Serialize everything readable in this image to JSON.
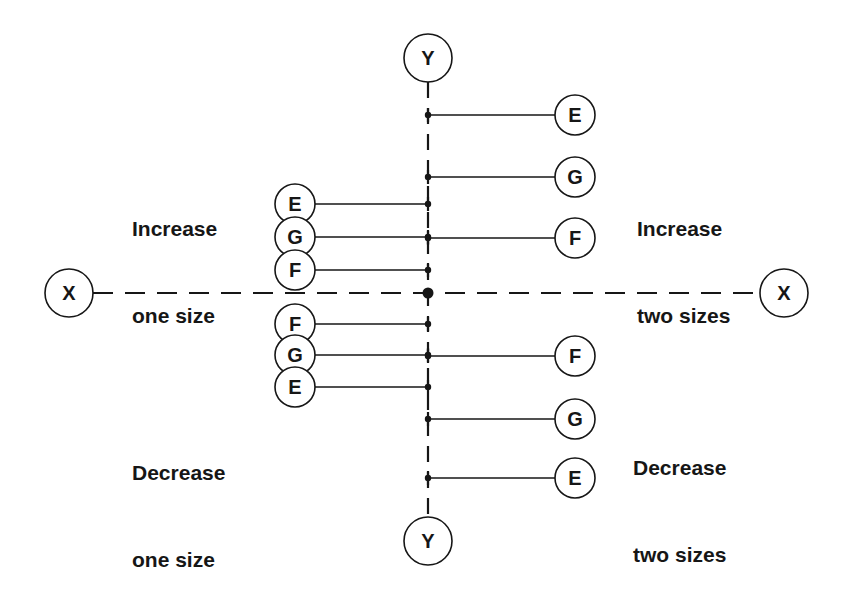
{
  "diagram": {
    "colors": {
      "ink": "#161616",
      "background": "#ffffff"
    },
    "center": {
      "x": 428,
      "y": 293
    },
    "axes": {
      "y_top": {
        "label": "Y",
        "x": 428,
        "y": 58
      },
      "y_bottom": {
        "label": "Y",
        "x": 428,
        "y": 541
      },
      "x_left": {
        "label": "X",
        "x": 69,
        "y": 293
      },
      "x_right": {
        "label": "X",
        "x": 784,
        "y": 293
      }
    },
    "groups": {
      "increase_one": {
        "title_line1": "Increase",
        "title_line2": "one size",
        "nodes": [
          {
            "label": "E",
            "x": 295,
            "y": 204
          },
          {
            "label": "G",
            "x": 295,
            "y": 237
          },
          {
            "label": "F",
            "x": 295,
            "y": 270
          }
        ]
      },
      "increase_two": {
        "title_line1": "Increase",
        "title_line2": "two sizes",
        "nodes": [
          {
            "label": "E",
            "x": 575,
            "y": 115
          },
          {
            "label": "G",
            "x": 575,
            "y": 177
          },
          {
            "label": "F",
            "x": 575,
            "y": 238
          }
        ]
      },
      "decrease_one": {
        "title_line1": "Decrease",
        "title_line2": "one size",
        "nodes": [
          {
            "label": "F",
            "x": 295,
            "y": 324
          },
          {
            "label": "G",
            "x": 295,
            "y": 355
          },
          {
            "label": "E",
            "x": 295,
            "y": 387
          }
        ]
      },
      "decrease_two": {
        "title_line1": "Decrease",
        "title_line2": "two sizes",
        "nodes": [
          {
            "label": "F",
            "x": 575,
            "y": 356
          },
          {
            "label": "G",
            "x": 575,
            "y": 419
          },
          {
            "label": "E",
            "x": 575,
            "y": 478
          }
        ]
      }
    }
  }
}
